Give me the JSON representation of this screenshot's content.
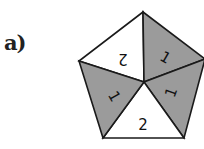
{
  "figure": {
    "label": "a)",
    "shape": "regular pentagon divided into 5 triangles from center",
    "colors": {
      "shaded": "#9b9b9b",
      "unshaded": "#ffffff",
      "stroke": "#1a1a1a"
    },
    "sectors": [
      {
        "position": "top-left",
        "shaded": false,
        "value": "2",
        "rotation": 180
      },
      {
        "position": "top-right",
        "shaded": true,
        "value": "1",
        "rotation": 0
      },
      {
        "position": "bottom-right",
        "shaded": true,
        "value": "1",
        "rotation": -70
      },
      {
        "position": "bottom",
        "shaded": false,
        "value": "2",
        "rotation": 0
      },
      {
        "position": "left",
        "shaded": true,
        "value": "1",
        "rotation": 60
      }
    ]
  }
}
